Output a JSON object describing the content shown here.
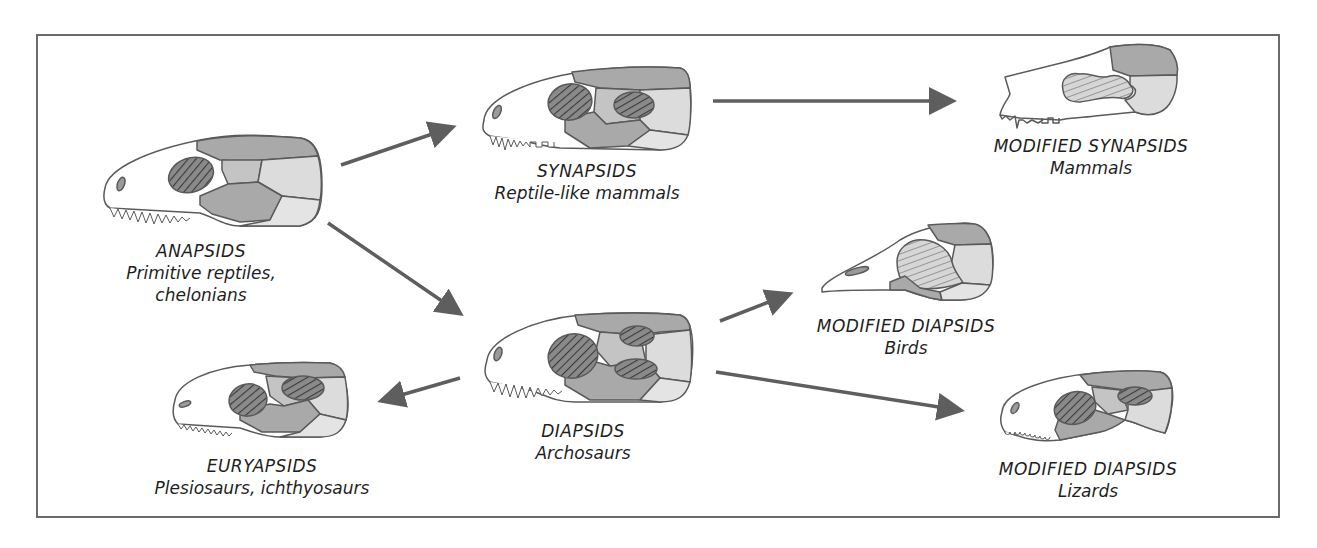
{
  "figure": {
    "colors": {
      "frame": "#6b6b6b",
      "outline": "#5a5a5a",
      "bone_white": "#ffffff",
      "bone_dark": "#a9a9a9",
      "bone_mid": "#c4c4c4",
      "bone_light": "#dcdcdc",
      "fenestra": "#6a6a6a",
      "arrow": "#5e5e5e",
      "text": "#1e1e1e"
    }
  },
  "nodes": [
    {
      "id": "anapsids",
      "group": "ANAPSIDS",
      "desc_line1": "Primitive reptiles,",
      "desc_line2": "chelonians",
      "openings": 1
    },
    {
      "id": "synapsids",
      "group": "SYNAPSIDS",
      "desc_line1": "Reptile-like mammals",
      "openings": 2
    },
    {
      "id": "modified-synapsids",
      "group": "MODIFIED SYNAPSIDS",
      "desc_line1": "Mammals"
    },
    {
      "id": "diapsids",
      "group": "DIAPSIDS",
      "desc_line1": "Archosaurs",
      "openings": 3
    },
    {
      "id": "modified-diapsids-birds",
      "group": "MODIFIED DIAPSIDS",
      "desc_line1": "Birds"
    },
    {
      "id": "euryapsids",
      "group": "EURYAPSIDS",
      "desc_line1": "Plesiosaurs, ichthyosaurs",
      "openings": 2
    },
    {
      "id": "modified-diapsids-lizards",
      "group": "MODIFIED DIAPSIDS",
      "desc_line1": "Lizards"
    }
  ],
  "edges": [
    {
      "from": "anapsids",
      "to": "synapsids"
    },
    {
      "from": "anapsids",
      "to": "diapsids"
    },
    {
      "from": "synapsids",
      "to": "modified-synapsids"
    },
    {
      "from": "diapsids",
      "to": "modified-diapsids-birds"
    },
    {
      "from": "diapsids",
      "to": "modified-diapsids-lizards"
    },
    {
      "from": "diapsids",
      "to": "euryapsids"
    }
  ]
}
